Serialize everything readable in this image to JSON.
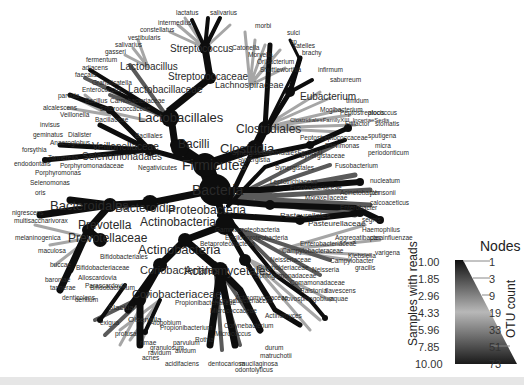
{
  "figure": {
    "type": "taxonomic heat tree",
    "root_label": "Bacteria"
  },
  "nodes": {
    "major": [
      {
        "label": "Firmicutes",
        "x": 210,
        "y": 163,
        "size": 15
      },
      {
        "label": "Bacilli",
        "x": 185,
        "y": 150,
        "size": 13
      },
      {
        "label": "Lactobacillales",
        "x": 168,
        "y": 118,
        "size": 13
      },
      {
        "label": "Clostridia",
        "x": 260,
        "y": 148,
        "size": 14
      },
      {
        "label": "Clostridiales",
        "x": 262,
        "y": 128,
        "size": 13
      },
      {
        "label": "Bacteroidetes",
        "x": 160,
        "y": 200,
        "size": 13
      },
      {
        "label": "Bacteroidia",
        "x": 148,
        "y": 208,
        "size": 13
      },
      {
        "label": "Bacteroidales",
        "x": 110,
        "y": 204,
        "size": 14
      },
      {
        "label": "Prevotella",
        "x": 87,
        "y": 225,
        "size": 12
      },
      {
        "label": "Prevotellaceae",
        "x": 100,
        "y": 238,
        "size": 13
      },
      {
        "label": "Proteobacteria",
        "x": 185,
        "y": 210,
        "size": 12
      },
      {
        "label": "Actinobacteria",
        "x": 178,
        "y": 227,
        "size": 13
      },
      {
        "label": "Actinobacteria",
        "x": 165,
        "y": 250,
        "size": 14
      },
      {
        "label": "Actinomycetales",
        "x": 215,
        "y": 263,
        "size": 13
      },
      {
        "label": "Coriobacteriales",
        "x": 160,
        "y": 270,
        "size": 12
      },
      {
        "label": "Coriobacteriaceae",
        "x": 148,
        "y": 294,
        "size": 12
      },
      {
        "label": "Streptococcus",
        "x": 205,
        "y": 48,
        "size": 12
      },
      {
        "label": "Streptococcaceae",
        "x": 215,
        "y": 77,
        "size": 12
      },
      {
        "label": "Lactobacillus",
        "x": 145,
        "y": 67,
        "size": 12
      },
      {
        "label": "Lactobacillaceae",
        "x": 178,
        "y": 90,
        "size": 12
      },
      {
        "label": "Eubacterium",
        "x": 305,
        "y": 97,
        "size": 12
      },
      {
        "label": "Selenomonadales",
        "x": 120,
        "y": 153,
        "size": 11
      },
      {
        "label": "Veillonellaceae",
        "x": 115,
        "y": 145,
        "size": 11
      },
      {
        "label": "Lachnospiraceae",
        "x": 250,
        "y": 85,
        "size": 11
      },
      {
        "label": "Pasteurellales",
        "x": 290,
        "y": 235,
        "size": 10
      },
      {
        "label": "Pasteurellaceae",
        "x": 310,
        "y": 243,
        "size": 10
      }
    ],
    "minor": [
      "lactatus",
      "salivarius",
      "intermedius",
      "constellatus",
      "vestibularis",
      "salivarius",
      "gasseri",
      "fermentum",
      "adiacens",
      "faecalis",
      "Granulicatella",
      "Enterococcus",
      "Bacillus",
      "Carnobacteriaceae",
      "Enterococcaceae",
      "parvula",
      "alcalescens",
      "Veillonella",
      "Bacillaceae",
      "Bacillales",
      "invisus",
      "geminatus",
      "Dialister",
      "Anaeroglobus",
      "forsythia",
      "Tannerella",
      "Porphyromonadaceae",
      "endodontalis",
      "Porphyromonas",
      "Negativicutes",
      "ClostridialesFamilyXIII_IncertaeSedis",
      "Peptostreptococcaceae",
      "Peptostreptococcus",
      "Filifactor",
      "stomatis",
      "alocis",
      "Mogibacterium",
      "timidum",
      "infirmum",
      "saburreum",
      "brachy",
      "sulci",
      "sp",
      "Catonella",
      "morbi",
      "Moryella",
      "Oribacterium",
      "Shuttleworthia",
      "satelles",
      "Parvimonas",
      "micra",
      "ClostridialesFamilyXI",
      "Synergistetes",
      "Synergistia",
      "Synergistaceae",
      "Synergistales",
      "periodonticum",
      "Fusobacterium",
      "nucleatum",
      "Leptotrichiaceae",
      "Fusobacteriaceae",
      "Moraxellaceae",
      "Acinetobacter",
      "calcoaceticus",
      "johnsonii",
      "Enterobacter",
      "Aggregatibacter",
      "Haemophilus",
      "parainfluenzae",
      "segnis",
      "Enterobacteriaceae",
      "Campylobacteraceae",
      "Campylobacter",
      "varigena",
      "Klebsiella",
      "gracilis",
      "Neisseriaceae",
      "Neisseria",
      "Burkholderiaceae",
      "Sphingomonadaceae",
      "Comamonadaceae",
      "Ralstonia",
      "flavescens",
      "Novosphingobium",
      "aquae",
      "Epsilonproteobacteria",
      "Betaproteobacteria",
      "Gammaproteobacteria",
      "Actinomycetaceae",
      "Actinomyces",
      "Corynebacteriaceae",
      "Corynebacterium",
      "durum",
      "matruchotii",
      "Micrococcaceae",
      "Micrococcus",
      "Rothia",
      "mucilaginosa",
      "dentocariosa",
      "odontolyticus",
      "Propionibacteriaceae",
      "Propionibacterium",
      "acnes",
      "acidifaciens",
      "avidum",
      "granulosum",
      "Olsenella",
      "Atopobium",
      "parvulum",
      "rimae",
      "Slackia",
      "exigua",
      "Bifidobacteriales",
      "Bifidobacteriaceae",
      "Bifidobacterium",
      "dentium",
      "Alloscardovia",
      "Parascardovia",
      "denticolens",
      "tannerae",
      "baroniae",
      "buccae",
      "maculosa",
      "melaninogenica",
      "multisaccharivorax",
      "nigrescens",
      "oris",
      "profusa",
      "ravidum",
      "sputigena",
      "Selenomonas"
    ]
  },
  "legend": {
    "title": "Nodes",
    "left_axis_label": "Samples with reads",
    "right_axis_label": "OTU count",
    "left_ticks": [
      "1.00",
      "1.85",
      "2.96",
      "4.33",
      "5.96",
      "7.85",
      "10.00"
    ],
    "right_ticks": [
      "1",
      "3",
      "9",
      "19",
      "33",
      "51",
      "73"
    ],
    "gradient": {
      "top": "#111111",
      "middle": "#b5b5b5",
      "bottom": "#1a1a1a"
    }
  },
  "colors": {
    "branch_dark": "#0d0d0d",
    "branch_mid": "#5a5a5a",
    "branch_light": "#a8a8a8",
    "label": "#2a2a2a",
    "background": "#ffffff"
  }
}
